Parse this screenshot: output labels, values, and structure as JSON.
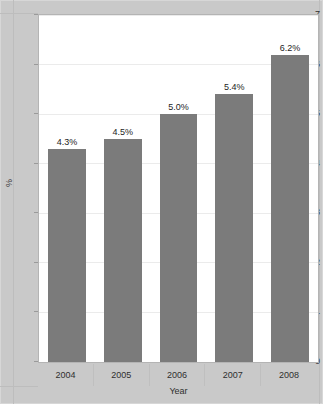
{
  "chart_data": {
    "type": "bar",
    "title": "",
    "subtitle": "",
    "xlabel": "Year",
    "ylabel": "%",
    "categories": [
      "2004",
      "2005",
      "2006",
      "2007",
      "2008"
    ],
    "values": [
      4.3,
      4.5,
      5.0,
      5.4,
      6.2
    ],
    "data_labels": [
      "4.3%",
      "4.5%",
      "5.0%",
      "5.4%",
      "6.2%"
    ],
    "series": [
      {
        "name": "",
        "values": [
          4.3,
          4.5,
          5.0,
          5.4,
          6.2
        ]
      }
    ],
    "ylim": [
      0,
      7
    ],
    "y_ticks": [
      0,
      1,
      2,
      3,
      4,
      5,
      6,
      7
    ],
    "y_tick_labels": [
      "0",
      "1",
      "2",
      "3",
      "4",
      "5",
      "6",
      "7"
    ],
    "grid": true,
    "grid_axis": "y",
    "legend": false,
    "legend_position": "none",
    "colors": {
      "bar": "#7b7b7b",
      "plot_background": "#ffffff",
      "figure_background": "#c9c9c9",
      "gridline": "#ebebeb",
      "axis_border": "#b4b4b4",
      "text": "#2f2f2f"
    }
  }
}
